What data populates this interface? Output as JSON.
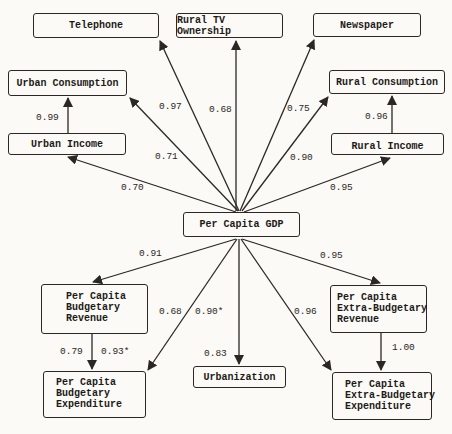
{
  "nodes": {
    "telephone": {
      "label": "Telephone"
    },
    "rural_tv": {
      "label": "Rural TV Ownership"
    },
    "newspaper": {
      "label": "Newspaper"
    },
    "urban_consumption": {
      "label": "Urban Consumption"
    },
    "urban_income": {
      "label": "Urban Income"
    },
    "rural_consumption": {
      "label": "Rural Consumption"
    },
    "rural_income": {
      "label": "Rural Income"
    },
    "gdp": {
      "label": "Per Capita GDP"
    },
    "budget_revenue": {
      "lines": [
        "Per Capita",
        "Budgetary",
        "Revenue"
      ]
    },
    "budget_expenditure": {
      "lines": [
        "Per Capita",
        "Budgetary",
        "Expenditure"
      ]
    },
    "urbanization": {
      "label": "Urbanization"
    },
    "extra_revenue": {
      "lines": [
        "Per Capita",
        "Extra-Budgetary",
        "Revenue"
      ]
    },
    "extra_expenditure": {
      "lines": [
        "Per Capita",
        "Extra-Budgetary",
        "Expenditure"
      ]
    }
  },
  "edges": {
    "gdp_telephone": "0.97",
    "gdp_rural_tv": "0.68",
    "gdp_newspaper": "0.75",
    "gdp_urban_consumption": "0.71",
    "gdp_urban_income": "0.70",
    "gdp_rural_consumption": "0.90",
    "gdp_rural_income": "0.95",
    "urban_income_consumption": "0.99",
    "rural_income_consumption": "0.96",
    "gdp_budget_revenue": "0.91",
    "gdp_budget_expenditure": "0.68",
    "gdp_budget_expenditure_alt": "0.90*",
    "gdp_urbanization": "0.83",
    "gdp_extra_revenue": "0.95",
    "gdp_extra_expenditure": "0.96",
    "budget_rev_exp": "0.79",
    "budget_rev_exp_alt": "0.93*",
    "extra_rev_exp": "1.00"
  },
  "colors": {
    "line": "#2a2724",
    "background": "#fbfaf6"
  }
}
